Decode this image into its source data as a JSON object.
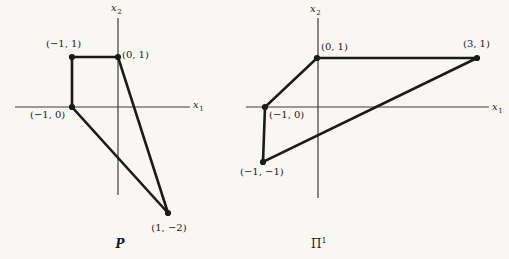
{
  "figure": {
    "width": 509,
    "height": 259,
    "background": "#f8f7f4",
    "ink": "#1a1a1a",
    "axis_stroke": "#3d3d3d",
    "diagrams": [
      {
        "id": "P",
        "caption": {
          "base": "P",
          "sup": "",
          "px": [
            120,
            248
          ],
          "anchor": "middle",
          "italic": true
        },
        "x_axis": {
          "y": 107,
          "x1": 15,
          "x2": 190,
          "label": {
            "base": "x",
            "sub": "1",
            "px": [
              193,
              108
            ]
          }
        },
        "y_axis": {
          "x": 118,
          "y1": 18,
          "y2": 195,
          "label": {
            "base": "x",
            "sub": "2",
            "px": [
              111,
              11
            ]
          }
        },
        "vertices": [
          {
            "coord": "(−1, 1)",
            "math": [
              -1,
              1
            ],
            "px": [
              72,
              57
            ],
            "label_px": [
              46,
              47
            ],
            "anchor": "start"
          },
          {
            "coord": "(0, 1)",
            "math": [
              0,
              1
            ],
            "px": [
              118,
              57
            ],
            "label_px": [
              122,
              58
            ],
            "anchor": "start"
          },
          {
            "coord": "(1, −2)",
            "math": [
              1,
              -2
            ],
            "px": [
              168,
              213
            ],
            "label_px": [
              169,
              231
            ],
            "anchor": "middle"
          },
          {
            "coord": "(−1, 0)",
            "math": [
              -1,
              0
            ],
            "px": [
              72,
              107
            ],
            "label_px": [
              30,
              118
            ],
            "anchor": "start"
          }
        ]
      },
      {
        "id": "Pi1",
        "caption": {
          "base": "Π",
          "sup": "1",
          "px": [
            311,
            248
          ],
          "anchor": "start",
          "italic": false
        },
        "x_axis": {
          "y": 107,
          "x1": 246,
          "x2": 489,
          "label": {
            "base": "x",
            "sub": "1",
            "px": [
              492,
              110
            ]
          }
        },
        "y_axis": {
          "x": 318,
          "y1": 18,
          "y2": 198,
          "label": {
            "base": "x",
            "sub": "2",
            "px": [
              310,
              12
            ]
          }
        },
        "vertices": [
          {
            "coord": "(0, 1)",
            "math": [
              0,
              1
            ],
            "px": [
              317,
              58
            ],
            "label_px": [
              321,
              50
            ],
            "anchor": "start"
          },
          {
            "coord": "(3, 1)",
            "math": [
              3,
              1
            ],
            "px": [
              477,
              58
            ],
            "label_px": [
              463,
              47
            ],
            "anchor": "start"
          },
          {
            "coord": "(−1, −1)",
            "math": [
              -1,
              -1
            ],
            "px": [
              263,
              162
            ],
            "label_px": [
              240,
              175
            ],
            "anchor": "start"
          },
          {
            "coord": "(−1, 0)",
            "math": [
              -1,
              0
            ],
            "px": [
              265,
              107
            ],
            "label_px": [
              269,
              118
            ],
            "anchor": "start"
          }
        ]
      }
    ]
  }
}
